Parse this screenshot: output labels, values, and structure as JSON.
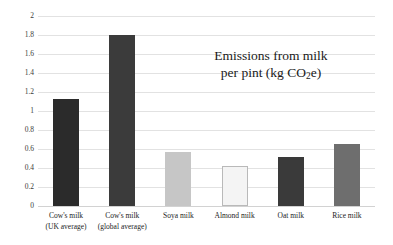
{
  "chart_data": {
    "type": "bar",
    "title": "Emissions from milk per pint (kg CO2e)",
    "title_line1": "Emissions from milk",
    "title_line2_pre": "per pint (kg CO",
    "title_line2_sub": "2",
    "title_line2_post": "e)",
    "xlabel": "",
    "ylabel": "",
    "ylim": [
      0,
      2
    ],
    "ytick_step": 0.2,
    "grid": true,
    "legend": "none",
    "categories": [
      "Cow's milk (UK average)",
      "Cow's milk (global average)",
      "Soya milk",
      "Almond milk",
      "Oat milk",
      "Rice milk"
    ],
    "values": [
      1.13,
      1.8,
      0.57,
      0.42,
      0.52,
      0.65
    ],
    "bar_colors": [
      "#2b2b2b",
      "#3b3b3b",
      "#c6c6c6",
      "#f4f4f4",
      "#3a3a3a",
      "#6e6e6e"
    ]
  },
  "axis": {
    "yticks": [
      {
        "label": "2",
        "value": 2.0
      },
      {
        "label": "1.8",
        "value": 1.8
      },
      {
        "label": "1.6",
        "value": 1.6
      },
      {
        "label": "1.4",
        "value": 1.4
      },
      {
        "label": "1.2",
        "value": 1.2
      },
      {
        "label": "1",
        "value": 1.0
      },
      {
        "label": "0.8",
        "value": 0.8
      },
      {
        "label": "0.6",
        "value": 0.6
      },
      {
        "label": "0.4",
        "value": 0.4
      },
      {
        "label": "0.2",
        "value": 0.2
      },
      {
        "label": "0",
        "value": 0.0
      }
    ]
  },
  "bars": [
    {
      "label_line1": "Cow's milk",
      "label_line2": "(UK average)",
      "value": 1.13,
      "color": "#2b2b2b",
      "border": "none"
    },
    {
      "label_line1": "Cow's milk",
      "label_line2": "(global average)",
      "value": 1.8,
      "color": "#3b3b3b",
      "border": "none"
    },
    {
      "label_line1": "Soya milk",
      "label_line2": "",
      "value": 0.57,
      "color": "#c6c6c6",
      "border": "none"
    },
    {
      "label_line1": "Almond milk",
      "label_line2": "",
      "value": 0.42,
      "color": "#f4f4f4",
      "border": "#b9b9b9"
    },
    {
      "label_line1": "Oat milk",
      "label_line2": "",
      "value": 0.52,
      "color": "#3a3a3a",
      "border": "none"
    },
    {
      "label_line1": "Rice milk",
      "label_line2": "",
      "value": 0.65,
      "color": "#6e6e6e",
      "border": "none"
    }
  ]
}
